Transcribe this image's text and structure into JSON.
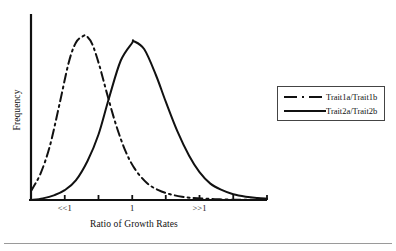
{
  "chart_data": {
    "type": "line",
    "title": "",
    "subtitle": "",
    "xlabel": "Ratio of Growth Rates",
    "ylabel": "Frequency",
    "xlim": [
      0,
      10
    ],
    "ylim": [
      0,
      1.05
    ],
    "grid": false,
    "legend_position": "right",
    "xticks": [
      0,
      1.43,
      2.86,
      4.29,
      5.71,
      7.14,
      8.57,
      10
    ],
    "xtick_labels": [
      "",
      "<<1",
      "",
      "1",
      "",
      ">>1",
      "",
      ""
    ],
    "annotations": [
      {
        "text": "<<1",
        "x": 1.43
      },
      {
        "text": "1",
        "x": 4.29
      },
      {
        "text": ">>1",
        "x": 7.14
      }
    ],
    "series": [
      {
        "name": "Trait1a/Trait1b",
        "style": "dash-dot",
        "color": "#111111",
        "peak_x": 4.35,
        "peak_y": 0.97,
        "spread": 1.35,
        "x": [
          0.0,
          0.5,
          1.0,
          1.43,
          1.9,
          2.4,
          2.86,
          3.3,
          3.8,
          4.29,
          4.35,
          4.8,
          5.3,
          5.71,
          6.2,
          6.7,
          7.14,
          7.6,
          8.1,
          8.57,
          9.1,
          9.6,
          10.0
        ],
        "y": [
          0.0,
          0.01,
          0.03,
          0.06,
          0.12,
          0.24,
          0.4,
          0.62,
          0.85,
          0.96,
          0.97,
          0.92,
          0.76,
          0.6,
          0.42,
          0.27,
          0.17,
          0.1,
          0.06,
          0.035,
          0.02,
          0.012,
          0.008
        ]
      },
      {
        "name": "Trait2a/Trait2b",
        "style": "solid",
        "color": "#111111",
        "peak_x": 2.36,
        "peak_y": 1.0,
        "spread": 1.1,
        "x": [
          0.0,
          0.4,
          0.8,
          1.2,
          1.6,
          1.9,
          2.2,
          2.36,
          2.6,
          2.9,
          3.2,
          3.6,
          4.0,
          4.4,
          4.9,
          5.4,
          5.9,
          6.4,
          6.9,
          7.4,
          8.0,
          8.6,
          9.2,
          10.0
        ],
        "y": [
          0.055,
          0.16,
          0.33,
          0.58,
          0.84,
          0.96,
          1.0,
          1.0,
          0.95,
          0.82,
          0.66,
          0.46,
          0.3,
          0.19,
          0.105,
          0.06,
          0.035,
          0.02,
          0.012,
          0.008,
          0.004,
          0.002,
          0.001,
          0.0
        ]
      }
    ]
  },
  "legend": {
    "items": [
      {
        "label": "Trait1a/Trait1b",
        "style": "dash-dot"
      },
      {
        "label": "Trait2a/Trait2b",
        "style": "solid"
      }
    ]
  }
}
